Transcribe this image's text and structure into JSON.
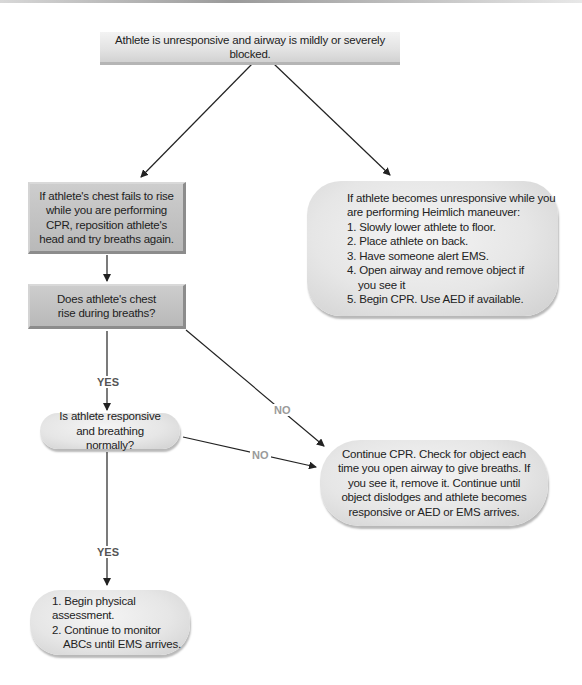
{
  "nodes": {
    "start": {
      "text": "Athlete is unresponsive and airway is mildly or severely blocked."
    },
    "reposition": {
      "text": "If athlete's chest fails to rise while you are performing CPR, reposition athlete's head and try breaths again."
    },
    "chest_rise": {
      "text": "Does athlete's chest rise during breaths?"
    },
    "responsive": {
      "text": "Is athlete responsive and breathing normally?"
    },
    "heimlich": {
      "intro": "If athlete becomes unresponsive while you are performing Heimlich maneuver:",
      "steps": [
        "1. Slowly lower athlete to floor.",
        "2. Place athlete on back.",
        "3. Have someone alert EMS.",
        "4. Open airway and remove object if",
        "you see it",
        "5. Begin CPR. Use AED if available."
      ]
    },
    "continue_cpr": {
      "text": "Continue CPR. Check for object each time you open airway to give breaths. If you see it, remove it. Continue until object dislodges and athlete becomes responsive or AED or EMS arrives."
    },
    "assessment": {
      "steps": [
        "1. Begin physical assessment.",
        "2. Continue to monitor",
        "ABCs until EMS arrives."
      ]
    }
  },
  "edges": {
    "yes_1": "YES",
    "yes_2": "YES",
    "no_1": "NO",
    "no_2": "NO"
  },
  "colors": {
    "rect_fill": "#c2c2c2",
    "pill_fill": "#e6e6e6",
    "banner_fill": "#e2e2e2",
    "arrow": "#222222",
    "no_label": "#9a9a9a",
    "yes_label": "#555555"
  }
}
